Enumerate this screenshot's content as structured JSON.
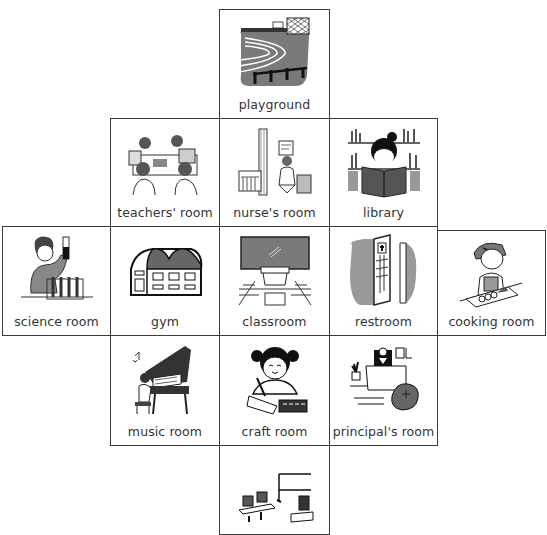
{
  "grid": {
    "cells": [
      {
        "id": "playground",
        "label": "playground",
        "icon": "playground-icon"
      },
      {
        "id": "teachers-room",
        "label": "teachers' room",
        "icon": "teachers-room-icon"
      },
      {
        "id": "nurses-room",
        "label": "nurse's  room",
        "icon": "nurses-room-icon"
      },
      {
        "id": "library",
        "label": "library",
        "icon": "library-icon"
      },
      {
        "id": "science-room",
        "label": "science  room",
        "icon": "science-room-icon"
      },
      {
        "id": "gym",
        "label": "gym",
        "icon": "gym-icon"
      },
      {
        "id": "classroom",
        "label": "classroom",
        "icon": "classroom-icon"
      },
      {
        "id": "restroom",
        "label": "restroom",
        "icon": "restroom-icon"
      },
      {
        "id": "cooking-room",
        "label": "cooking  room",
        "icon": "cooking-room-icon"
      },
      {
        "id": "music-room",
        "label": "music  room",
        "icon": "music-room-icon"
      },
      {
        "id": "craft-room",
        "label": "craft  room",
        "icon": "craft-room-icon"
      },
      {
        "id": "principals-room",
        "label": "principal's  room",
        "icon": "principals-room-icon"
      },
      {
        "id": "computer-room",
        "label": "",
        "icon": "computer-room-icon"
      }
    ]
  },
  "colors": {
    "border": "#3a3a3a",
    "gray_fill": "#7a7a7a",
    "text": "#333333"
  }
}
